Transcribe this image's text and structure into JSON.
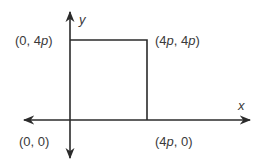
{
  "diagram": {
    "type": "coordinate-plane",
    "axes": {
      "x_label": "x",
      "y_label": "y"
    },
    "shape": "square",
    "vertices": [
      {
        "name": "origin",
        "coords": "(0, 0)",
        "parts": [
          "(0, 0)"
        ]
      },
      {
        "name": "top-left",
        "coords": "(0, 4p)",
        "parts": [
          "(0, 4",
          "p",
          ")"
        ]
      },
      {
        "name": "top-right",
        "coords": "(4p, 4p)",
        "parts": [
          "(4",
          "p",
          ", 4",
          "p",
          ")"
        ]
      },
      {
        "name": "bottom-right",
        "coords": "(4p, 0)",
        "parts": [
          "(4",
          "p",
          ", 0)"
        ]
      }
    ],
    "colors": {
      "line": "#2b2b2b",
      "text": "#3a3a3a"
    }
  }
}
